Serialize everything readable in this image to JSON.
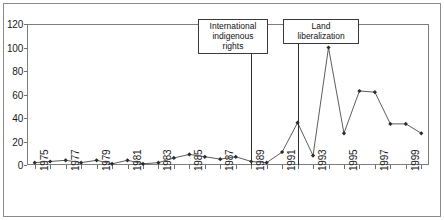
{
  "figure": {
    "background_color": "#ffffff",
    "frame_color": "#8a8a8a",
    "axis_color": "#7d7d7d",
    "line_color": "#4a4a4a",
    "marker_color": "#2b2b2b",
    "annotation_line_color": "#2e2e2e"
  },
  "annotations": [
    {
      "id": "international-indigenous-rights",
      "label": "International\nindigenous rights",
      "year": 1989,
      "box_left": 198,
      "box_top": 19,
      "box_width": 70,
      "box_height": 24
    },
    {
      "id": "land-liberalization",
      "label": "Land liberalization",
      "year": 1992,
      "box_left": 283,
      "box_top": 19,
      "box_width": 76,
      "box_height": 14
    }
  ],
  "chart_data": {
    "type": "line",
    "title": "",
    "subtitle": "",
    "xlabel": "",
    "ylabel": "",
    "xlim": [
      1975,
      2000
    ],
    "ylim": [
      0,
      120
    ],
    "ytick_step": 20,
    "grid": false,
    "legend": null,
    "marker": "diamond",
    "yticks": [
      0,
      20,
      40,
      60,
      80,
      100,
      120
    ],
    "ytick_labels": [
      "0",
      "20",
      "40",
      "60",
      "80",
      "100",
      "120"
    ],
    "x": [
      1975,
      1976,
      1977,
      1978,
      1979,
      1980,
      1981,
      1982,
      1983,
      1984,
      1985,
      1986,
      1987,
      1988,
      1989,
      1990,
      1991,
      1992,
      1993,
      1994,
      1995,
      1996,
      1997,
      1998,
      1999,
      2000
    ],
    "xtick_labels": [
      "1975",
      "",
      "1977",
      "",
      "1979",
      "",
      "1981",
      "",
      "1983",
      "",
      "1985",
      "",
      "1987",
      "",
      "1989",
      "",
      "1991",
      "",
      "1993",
      "",
      "1995",
      "",
      "1997",
      "",
      "1999",
      ""
    ],
    "xtick_labels_shown": [
      "1975",
      "1977",
      "1979",
      "1981",
      "1983",
      "1985",
      "1987",
      "1989",
      "1991",
      "1993",
      "1995",
      "1997",
      "1999"
    ],
    "xtick_rotation": 90,
    "values": [
      2,
      3,
      4,
      2,
      4,
      1,
      4,
      1,
      2,
      6,
      9,
      7,
      5,
      7,
      3,
      2,
      11,
      36,
      8,
      100,
      27,
      63,
      62,
      35,
      35,
      27
    ],
    "series": [
      {
        "name": "series-1",
        "values": [
          2,
          3,
          4,
          2,
          4,
          1,
          4,
          1,
          2,
          6,
          9,
          7,
          5,
          7,
          3,
          2,
          11,
          36,
          8,
          100,
          27,
          63,
          62,
          35,
          35,
          27
        ]
      }
    ]
  }
}
